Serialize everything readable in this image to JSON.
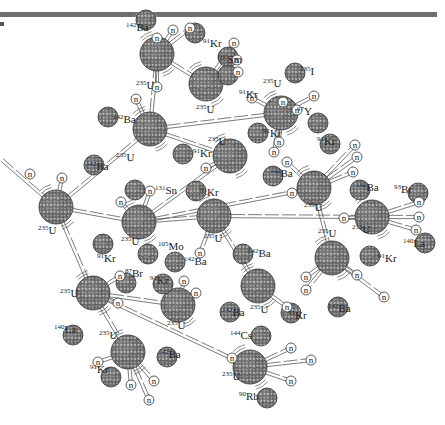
{
  "figure": {
    "title": "",
    "colors": {
      "header_bar": "#6e6e6e",
      "nucleus_dark": "#5a5a5a",
      "nucleus_light": "#9a9a9a",
      "line": "#444444",
      "glow": "#d9d9d9"
    },
    "neutron_symbol": "n",
    "uranium": [
      {
        "id": "u1",
        "mass": "235",
        "symbol": "U",
        "x": 56,
        "y": 207
      },
      {
        "id": "u2",
        "mass": "235",
        "symbol": "U",
        "x": 150,
        "y": 129
      },
      {
        "id": "u3",
        "mass": "235",
        "symbol": "U",
        "x": 139,
        "y": 222
      },
      {
        "id": "u4",
        "mass": "235",
        "symbol": "U",
        "x": 93,
        "y": 293
      },
      {
        "id": "u5",
        "mass": "235",
        "symbol": "U",
        "x": 128,
        "y": 352
      },
      {
        "id": "u6",
        "mass": "235",
        "symbol": "U",
        "x": 178,
        "y": 305
      },
      {
        "id": "u7",
        "mass": "235",
        "symbol": "U",
        "x": 157,
        "y": 54
      },
      {
        "id": "u8",
        "mass": "235",
        "symbol": "U",
        "x": 206,
        "y": 84
      },
      {
        "id": "u9",
        "mass": "235",
        "symbol": "U",
        "x": 281,
        "y": 113
      },
      {
        "id": "u10",
        "mass": "235",
        "symbol": "U",
        "x": 230,
        "y": 156
      },
      {
        "id": "u11",
        "mass": "235",
        "symbol": "U",
        "x": 214,
        "y": 216
      },
      {
        "id": "u12",
        "mass": "235",
        "symbol": "U",
        "x": 314,
        "y": 188
      },
      {
        "id": "u13",
        "mass": "235",
        "symbol": "U",
        "x": 372,
        "y": 217
      },
      {
        "id": "u14",
        "mass": "235",
        "symbol": "U",
        "x": 332,
        "y": 258
      },
      {
        "id": "u15",
        "mass": "235",
        "symbol": "U",
        "x": 258,
        "y": 286
      },
      {
        "id": "u16",
        "mass": "235",
        "symbol": "U",
        "x": 250,
        "y": 367
      }
    ],
    "fragments": [
      {
        "mass": "142",
        "symbol": "Ba",
        "x": 146,
        "y": 20,
        "nx": 146,
        "ny": 20
      },
      {
        "mass": "91",
        "symbol": "Kr",
        "x": 195,
        "y": 33
      },
      {
        "mass": "160",
        "symbol": "Sm",
        "x": 228,
        "y": 57
      },
      {
        "mass": "91",
        "symbol": "Kr",
        "x": 228,
        "y": 75
      },
      {
        "mass": "135",
        "symbol": "I",
        "x": 295,
        "y": 73
      },
      {
        "mass": "97",
        "symbol": "Y",
        "x": 318,
        "y": 123
      },
      {
        "mass": "142",
        "symbol": "Ba",
        "x": 108,
        "y": 117
      },
      {
        "mass": "91",
        "symbol": "Kr",
        "x": 183,
        "y": 154
      },
      {
        "mass": "91",
        "symbol": "Kr",
        "x": 258,
        "y": 133
      },
      {
        "mass": "142",
        "symbol": "Ba",
        "x": 273,
        "y": 176
      },
      {
        "mass": "91",
        "symbol": "Kr",
        "x": 330,
        "y": 144
      },
      {
        "mass": "142",
        "symbol": "Ba",
        "x": 360,
        "y": 190
      },
      {
        "mass": "142",
        "symbol": "Ba",
        "x": 94,
        "y": 165
      },
      {
        "mass": "131",
        "symbol": "Sn",
        "x": 135,
        "y": 190
      },
      {
        "mass": "91",
        "symbol": "Kr",
        "x": 196,
        "y": 191
      },
      {
        "mass": "93",
        "symbol": "Br",
        "x": 418,
        "y": 193
      },
      {
        "mass": "140",
        "symbol": "La",
        "x": 425,
        "y": 243
      },
      {
        "mass": "91",
        "symbol": "Kr",
        "x": 103,
        "y": 244
      },
      {
        "mass": "105",
        "symbol": "Mo",
        "x": 148,
        "y": 254
      },
      {
        "mass": "142",
        "symbol": "Ba",
        "x": 175,
        "y": 262
      },
      {
        "mass": "142",
        "symbol": "Ba",
        "x": 243,
        "y": 254
      },
      {
        "mass": "91",
        "symbol": "Kr",
        "x": 370,
        "y": 256
      },
      {
        "mass": "87",
        "symbol": "Br",
        "x": 126,
        "y": 283
      },
      {
        "mass": "91",
        "symbol": "Kr",
        "x": 163,
        "y": 284
      },
      {
        "mass": "142",
        "symbol": "Ba",
        "x": 230,
        "y": 312
      },
      {
        "mass": "142",
        "symbol": "Ba",
        "x": 338,
        "y": 307
      },
      {
        "mass": "91",
        "symbol": "Kr",
        "x": 291,
        "y": 313
      },
      {
        "mass": "140",
        "symbol": "La",
        "x": 73,
        "y": 335
      },
      {
        "mass": "142",
        "symbol": "Ba",
        "x": 167,
        "y": 357
      },
      {
        "mass": "91",
        "symbol": "Kr",
        "x": 111,
        "y": 377
      },
      {
        "mass": "144",
        "symbol": "Cs",
        "x": 261,
        "y": 336
      },
      {
        "mass": "90",
        "symbol": "Rb",
        "x": 267,
        "y": 398
      }
    ],
    "labels": [
      {
        "mass": "142",
        "symbol": "Ba",
        "x": 126,
        "y": 31
      },
      {
        "mass": "91",
        "symbol": "Kr",
        "x": 203,
        "y": 47
      },
      {
        "mass": "160",
        "symbol": "Sm",
        "x": 217,
        "y": 63
      },
      {
        "mass": "91",
        "symbol": "Kr",
        "x": 239,
        "y": 98
      },
      {
        "mass": "235",
        "symbol": "U",
        "x": 136,
        "y": 89
      },
      {
        "mass": "235",
        "symbol": "U",
        "x": 196,
        "y": 113
      },
      {
        "mass": "135",
        "symbol": "I",
        "x": 300,
        "y": 75
      },
      {
        "mass": "235",
        "symbol": "U",
        "x": 263,
        "y": 87
      },
      {
        "mass": "97",
        "symbol": "Y",
        "x": 297,
        "y": 115
      },
      {
        "mass": "142",
        "symbol": "Ba",
        "x": 113,
        "y": 123
      },
      {
        "mass": "235",
        "symbol": "U",
        "x": 116,
        "y": 161
      },
      {
        "mass": "91",
        "symbol": "Kr",
        "x": 193,
        "y": 157
      },
      {
        "mass": "235",
        "symbol": "U",
        "x": 208,
        "y": 145
      },
      {
        "mass": "91",
        "symbol": "Kr",
        "x": 263,
        "y": 137
      },
      {
        "mass": "142",
        "symbol": "Ba",
        "x": 270,
        "y": 177
      },
      {
        "mass": "91",
        "symbol": "Kr",
        "x": 317,
        "y": 145
      },
      {
        "mass": "142",
        "symbol": "Ba",
        "x": 356,
        "y": 191
      },
      {
        "mass": "235",
        "symbol": "U",
        "x": 304,
        "y": 211
      },
      {
        "mass": "142",
        "symbol": "Ba",
        "x": 86,
        "y": 170
      },
      {
        "mass": "131",
        "symbol": "Sn",
        "x": 155,
        "y": 194
      },
      {
        "mass": "91",
        "symbol": "Kr",
        "x": 200,
        "y": 196
      },
      {
        "mass": "93",
        "symbol": "Br",
        "x": 394,
        "y": 193
      },
      {
        "mass": "140",
        "symbol": "La",
        "x": 403,
        "y": 247
      },
      {
        "mass": "235",
        "symbol": "U",
        "x": 352,
        "y": 233
      },
      {
        "mass": "235",
        "symbol": "U",
        "x": 38,
        "y": 234
      },
      {
        "mass": "235",
        "symbol": "U",
        "x": 121,
        "y": 245
      },
      {
        "mass": "105",
        "symbol": "Mo",
        "x": 158,
        "y": 250
      },
      {
        "mass": "235",
        "symbol": "U",
        "x": 204,
        "y": 242
      },
      {
        "mass": "91",
        "symbol": "Kr",
        "x": 97,
        "y": 262
      },
      {
        "mass": "142",
        "symbol": "Ba",
        "x": 184,
        "y": 265
      },
      {
        "mass": "142",
        "symbol": "Ba",
        "x": 248,
        "y": 257
      },
      {
        "mass": "235",
        "symbol": "U",
        "x": 318,
        "y": 237
      },
      {
        "mass": "91",
        "symbol": "Kr",
        "x": 378,
        "y": 262
      },
      {
        "mass": "87",
        "symbol": "Br",
        "x": 125,
        "y": 277
      },
      {
        "mass": "91",
        "symbol": "Kr",
        "x": 150,
        "y": 284
      },
      {
        "mass": "235",
        "symbol": "U",
        "x": 60,
        "y": 297
      },
      {
        "mass": "235",
        "symbol": "U",
        "x": 167,
        "y": 329
      },
      {
        "mass": "142",
        "symbol": "Ba",
        "x": 222,
        "y": 316
      },
      {
        "mass": "235",
        "symbol": "U",
        "x": 250,
        "y": 313
      },
      {
        "mass": "91",
        "symbol": "Kr",
        "x": 288,
        "y": 319
      },
      {
        "mass": "142",
        "symbol": "Ba",
        "x": 328,
        "y": 312
      },
      {
        "mass": "140",
        "symbol": "La",
        "x": 54,
        "y": 333
      },
      {
        "mass": "235",
        "symbol": "U",
        "x": 99,
        "y": 339
      },
      {
        "mass": "142",
        "symbol": "Ba",
        "x": 158,
        "y": 358
      },
      {
        "mass": "91",
        "symbol": "Kr",
        "x": 90,
        "y": 373
      },
      {
        "mass": "144",
        "symbol": "Cs",
        "x": 230,
        "y": 339
      },
      {
        "mass": "235",
        "symbol": "U",
        "x": 222,
        "y": 380
      },
      {
        "mass": "90",
        "symbol": "Rb",
        "x": 239,
        "y": 400
      }
    ],
    "neutrons": [
      {
        "x": 62,
        "y": 178
      },
      {
        "x": 121,
        "y": 202
      },
      {
        "x": 157,
        "y": 38
      },
      {
        "x": 173,
        "y": 30
      },
      {
        "x": 190,
        "y": 28
      },
      {
        "x": 234,
        "y": 43
      },
      {
        "x": 237,
        "y": 60
      },
      {
        "x": 238,
        "y": 72
      },
      {
        "x": 252,
        "y": 98
      },
      {
        "x": 283,
        "y": 102
      },
      {
        "x": 297,
        "y": 110
      },
      {
        "x": 314,
        "y": 96
      },
      {
        "x": 136,
        "y": 99
      },
      {
        "x": 157,
        "y": 87
      },
      {
        "x": 279,
        "y": 142
      },
      {
        "x": 274,
        "y": 152
      },
      {
        "x": 287,
        "y": 162
      },
      {
        "x": 150,
        "y": 191
      },
      {
        "x": 206,
        "y": 168
      },
      {
        "x": 355,
        "y": 145
      },
      {
        "x": 357,
        "y": 157
      },
      {
        "x": 353,
        "y": 172
      },
      {
        "x": 292,
        "y": 193
      },
      {
        "x": 344,
        "y": 218
      },
      {
        "x": 419,
        "y": 202
      },
      {
        "x": 419,
        "y": 217
      },
      {
        "x": 416,
        "y": 230
      },
      {
        "x": 98,
        "y": 362
      },
      {
        "x": 118,
        "y": 303
      },
      {
        "x": 120,
        "y": 276
      },
      {
        "x": 184,
        "y": 281
      },
      {
        "x": 196,
        "y": 293
      },
      {
        "x": 200,
        "y": 253
      },
      {
        "x": 306,
        "y": 277
      },
      {
        "x": 306,
        "y": 290
      },
      {
        "x": 287,
        "y": 307
      },
      {
        "x": 357,
        "y": 275
      },
      {
        "x": 384,
        "y": 297
      },
      {
        "x": 131,
        "y": 385
      },
      {
        "x": 154,
        "y": 381
      },
      {
        "x": 149,
        "y": 400
      },
      {
        "x": 232,
        "y": 358
      },
      {
        "x": 291,
        "y": 348
      },
      {
        "x": 311,
        "y": 360
      },
      {
        "x": 291,
        "y": 381
      }
    ],
    "incoming_neutron": {
      "from_x": 2,
      "from_y": 160,
      "to_x": 38,
      "to_y": 178
    }
  }
}
